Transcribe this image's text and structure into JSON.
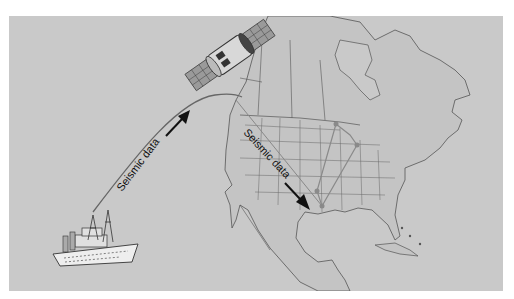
{
  "diagram": {
    "title": "",
    "labels": {
      "ship_to_satellite": "Seismic data",
      "satellite_to_ground": "Seismic data"
    },
    "nodes": [
      {
        "id": "ship",
        "name": "Research vessel"
      },
      {
        "id": "satellite",
        "name": "Communications satellite"
      },
      {
        "id": "ground",
        "name": "Ground station (Texas Gulf Coast)"
      }
    ],
    "edges": [
      {
        "from": "ship",
        "to": "satellite",
        "label": "Seismic data"
      },
      {
        "from": "satellite",
        "to": "ground",
        "label": "Seismic data"
      }
    ],
    "map_region": "North America",
    "colors": {
      "background": "#c9c9c9",
      "land": "#c4c4c4",
      "border": "#555555",
      "network": "#8a8a8a",
      "arrow": "#111111"
    }
  }
}
